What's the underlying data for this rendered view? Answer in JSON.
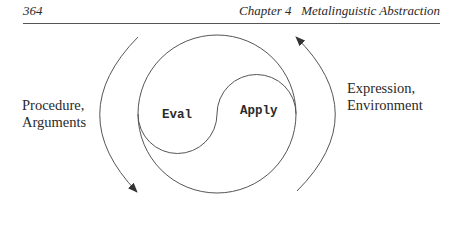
{
  "header": {
    "page_number": "364",
    "chapter": "Chapter 4   Metalinguistic Abstraction"
  },
  "figure": {
    "left_label": [
      "Procedure,",
      "Arguments"
    ],
    "right_label": [
      "Expression,",
      "Environment"
    ],
    "inner_left": "Eval",
    "inner_right": "Apply",
    "stroke_color": "#555555"
  }
}
